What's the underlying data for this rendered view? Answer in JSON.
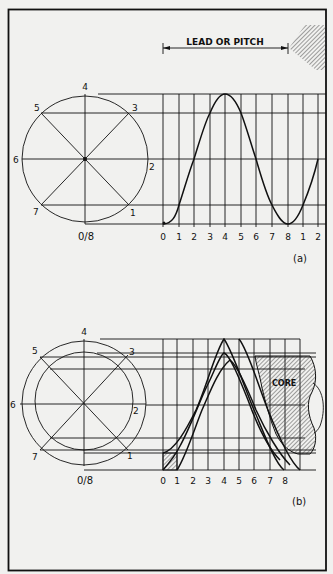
{
  "figure_a": {
    "title": "LEAD OR PITCH",
    "caption": "(a)",
    "circle_labels": [
      "0/8",
      "1",
      "2",
      "3",
      "4",
      "5",
      "6",
      "7"
    ],
    "x_axis_labels": [
      "0",
      "1",
      "2",
      "3",
      "4",
      "5",
      "6",
      "7",
      "8",
      "1",
      "2"
    ]
  },
  "figure_b": {
    "caption": "(b)",
    "core_label": "CORE",
    "circle_labels": [
      "0/8",
      "1",
      "2",
      "3",
      "4",
      "5",
      "6",
      "7"
    ],
    "x_axis_labels": [
      "0",
      "1",
      "2",
      "3",
      "4",
      "5",
      "6",
      "7",
      "8"
    ]
  },
  "colors": {
    "ink": "#111111",
    "paper": "#f1f1ef"
  }
}
